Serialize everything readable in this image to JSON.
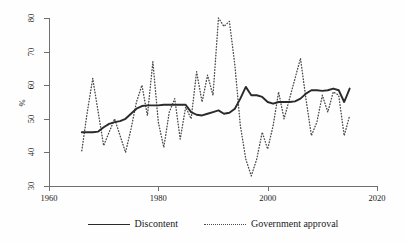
{
  "chart_data": {
    "type": "line",
    "title": "",
    "subtitle": "",
    "xlabel": "",
    "ylabel": "%",
    "xlim": [
      1960,
      2020
    ],
    "ylim": [
      30,
      80
    ],
    "grid": false,
    "legend_position": "bottom-center",
    "x_ticks": [
      1960,
      1980,
      2000,
      2020
    ],
    "y_ticks": [
      30,
      40,
      50,
      60,
      70,
      80
    ],
    "series": [
      {
        "name": "Discontent",
        "style": "solid",
        "color": "#2a2a2a",
        "x": [
          1966,
          1967,
          1968,
          1969,
          1970,
          1971,
          1972,
          1973,
          1974,
          1975,
          1976,
          1977,
          1978,
          1979,
          1980,
          1981,
          1982,
          1983,
          1984,
          1985,
          1986,
          1987,
          1988,
          1989,
          1990,
          1991,
          1992,
          1993,
          1994,
          1995,
          1996,
          1997,
          1998,
          1999,
          2000,
          2001,
          2002,
          2003,
          2004,
          2005,
          2006,
          2007,
          2008,
          2009,
          2010,
          2011,
          2012,
          2013,
          2014,
          2015
        ],
        "values": [
          46.0,
          46.0,
          46.0,
          46.2,
          47.5,
          48.5,
          49.0,
          49.3,
          50.0,
          51.5,
          53.0,
          53.8,
          54.0,
          54.0,
          54.0,
          54.2,
          54.2,
          54.2,
          54.2,
          54.2,
          52.0,
          51.2,
          51.0,
          51.5,
          52.0,
          52.5,
          51.5,
          51.8,
          53.0,
          56.0,
          59.5,
          57.0,
          57.0,
          56.5,
          55.0,
          54.5,
          55.0,
          55.0,
          55.0,
          55.2,
          56.0,
          57.5,
          58.5,
          58.5,
          58.3,
          58.5,
          59.0,
          58.5,
          55.0,
          59.0
        ]
      },
      {
        "name": "Government approval",
        "style": "dotted",
        "color": "#4a4a4a",
        "x": [
          1966,
          1967,
          1968,
          1969,
          1970,
          1971,
          1972,
          1973,
          1974,
          1975,
          1976,
          1977,
          1978,
          1979,
          1980,
          1981,
          1982,
          1983,
          1984,
          1985,
          1986,
          1987,
          1988,
          1989,
          1990,
          1991,
          1992,
          1993,
          1994,
          1995,
          1996,
          1997,
          1998,
          1999,
          2000,
          2001,
          2002,
          2003,
          2004,
          2005,
          2006,
          2007,
          2008,
          2009,
          2010,
          2011,
          2012,
          2013,
          2014,
          2015
        ],
        "values": [
          40.5,
          52.0,
          62.0,
          52.0,
          42.0,
          46.0,
          50.0,
          45.0,
          40.0,
          47.0,
          55.0,
          60.0,
          51.0,
          67.0,
          49.0,
          41.5,
          52.0,
          56.0,
          44.0,
          53.5,
          50.0,
          64.0,
          55.0,
          63.0,
          57.0,
          80.0,
          77.5,
          79.0,
          66.0,
          48.0,
          38.0,
          33.0,
          38.0,
          46.0,
          41.0,
          48.0,
          58.0,
          50.0,
          56.0,
          62.0,
          68.0,
          56.0,
          45.0,
          49.0,
          57.0,
          52.0,
          58.0,
          57.0,
          45.0,
          51.0
        ]
      }
    ]
  },
  "axes": {
    "y_title": "%",
    "y_tick_labels": [
      "80",
      "70",
      "60",
      "50",
      "40",
      "30"
    ],
    "x_tick_labels": [
      "1960",
      "1980",
      "2000",
      "2020"
    ]
  },
  "legend": {
    "entries": [
      {
        "label": "Discontent",
        "key": "solid-line-key"
      },
      {
        "label": "Government approval",
        "key": "dotted-line-key"
      }
    ]
  }
}
